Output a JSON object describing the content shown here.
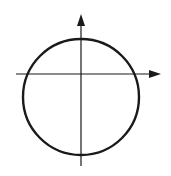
{
  "diagram": {
    "colors": {
      "background": "#ffffff",
      "stroke": "#1a1a1a"
    },
    "x_axis": {
      "x1": 16,
      "y": 74,
      "x2": 161,
      "arrow": "right"
    },
    "y_axis": {
      "x": 81,
      "y1": 166,
      "y2": 14,
      "arrow": "up"
    },
    "circle": {
      "cx": 81,
      "cy": 97,
      "r": 58
    }
  }
}
